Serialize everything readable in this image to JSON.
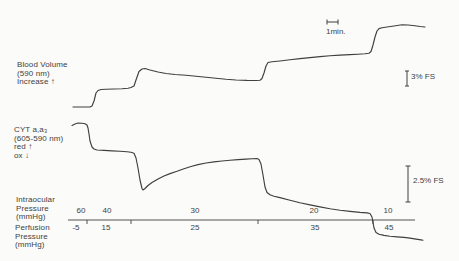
{
  "figure": {
    "bg_color": "#fbfbf9",
    "ink_color": "#3f3f3f"
  },
  "channel_labels": {
    "blood_volume": [
      "Blood Volume",
      "(590 nm)",
      "Increase ↑"
    ],
    "cytochrome": [
      "CYT a,a₃",
      "(605-590 nm)",
      "red ↑",
      "ox ↓"
    ]
  },
  "pressure_axis": {
    "intraocular": {
      "label": [
        "Intraocular",
        "Pressure",
        "(mmHg)"
      ],
      "values": [
        "60",
        "40",
        "30",
        "20",
        "10"
      ]
    },
    "perfusion": {
      "label": [
        "Perfusion",
        "Pressure",
        "(mmHg)"
      ],
      "values": [
        "-5",
        "15",
        "25",
        "35",
        "45"
      ]
    }
  },
  "scale_bars": {
    "time_label": "1min.",
    "blood_volume_label": "3% FS",
    "cytochrome_label": "2.5% FS"
  },
  "chart_data": {
    "type": "line",
    "title": "",
    "x_axis": {
      "label": "time",
      "scale_bar_minutes": 1,
      "scale_bar_px": 11
    },
    "y_axis": {
      "label": "% full scale",
      "scale_bars": [
        {
          "series": "Blood Volume (590 nm)",
          "label": "3% FS",
          "px": 15
        },
        {
          "series": "CYT a,a3 (605-590 nm)",
          "label": "2.5% FS",
          "px": 36
        }
      ]
    },
    "protocol_steps": [
      {
        "intraocular_mmHg": 60,
        "perfusion_mmHg": -5
      },
      {
        "intraocular_mmHg": 40,
        "perfusion_mmHg": 15
      },
      {
        "intraocular_mmHg": 30,
        "perfusion_mmHg": 25
      },
      {
        "intraocular_mmHg": 20,
        "perfusion_mmHg": 35
      },
      {
        "intraocular_mmHg": 10,
        "perfusion_mmHg": 45
      }
    ],
    "axis_line_px": {
      "x1": 68,
      "x2": 415,
      "y": 220,
      "tick_x": [
        87,
        131,
        258,
        373
      ],
      "tick_len": 4
    },
    "scale_bar_geometry_px": {
      "time": {
        "x1": 327,
        "x2": 338,
        "y": 22,
        "serif": 2.5
      },
      "blood_volume": {
        "x": 407,
        "y1": 71,
        "y2": 86,
        "serif": 2
      },
      "cytochrome": {
        "x": 408,
        "y1": 166,
        "y2": 202,
        "serif": 2.5
      }
    },
    "series": [
      {
        "name": "Blood Volume (590 nm)",
        "points_px": [
          [
            73,
            107
          ],
          [
            90,
            107
          ],
          [
            92,
            106
          ],
          [
            94,
            101
          ],
          [
            96,
            93
          ],
          [
            98,
            90.5
          ],
          [
            101,
            89.5
          ],
          [
            106,
            89.3
          ],
          [
            114,
            89
          ],
          [
            122,
            88.7
          ],
          [
            128,
            88.3
          ],
          [
            131,
            87.5
          ],
          [
            134,
            86
          ],
          [
            136,
            80
          ],
          [
            139,
            71.5
          ],
          [
            142,
            69
          ],
          [
            145,
            68.5
          ],
          [
            150,
            70
          ],
          [
            158,
            72
          ],
          [
            166,
            73.5
          ],
          [
            175,
            74.5
          ],
          [
            186,
            75.2
          ],
          [
            196,
            76.3
          ],
          [
            206,
            77.3
          ],
          [
            216,
            78.3
          ],
          [
            226,
            79.3
          ],
          [
            236,
            80
          ],
          [
            247,
            80.4
          ],
          [
            256,
            80.5
          ],
          [
            260,
            80.3
          ],
          [
            262,
            78.5
          ],
          [
            264,
            73
          ],
          [
            266,
            66
          ],
          [
            268,
            62.5
          ],
          [
            272,
            61.8
          ],
          [
            280,
            61
          ],
          [
            290,
            59.8
          ],
          [
            300,
            58.6
          ],
          [
            310,
            57.6
          ],
          [
            320,
            56.6
          ],
          [
            330,
            55.7
          ],
          [
            340,
            55.1
          ],
          [
            350,
            54.6
          ],
          [
            358,
            54.2
          ],
          [
            365,
            53.8
          ],
          [
            369,
            53.2
          ],
          [
            371,
            51.5
          ],
          [
            373,
            45
          ],
          [
            375,
            37
          ],
          [
            377,
            31
          ],
          [
            379,
            28.6
          ],
          [
            382,
            27.8
          ],
          [
            387,
            27
          ],
          [
            394,
            26
          ],
          [
            402,
            24.8
          ],
          [
            408,
            25
          ],
          [
            415,
            25.8
          ],
          [
            420,
            26.5
          ],
          [
            425,
            27
          ]
        ]
      },
      {
        "name": "CYT a,a3 (605-590 nm)",
        "points_px": [
          [
            72,
            125.5
          ],
          [
            75,
            124
          ],
          [
            78,
            123
          ],
          [
            82,
            123.2
          ],
          [
            85,
            123.8
          ],
          [
            87,
            125
          ],
          [
            88,
            128
          ],
          [
            89,
            134
          ],
          [
            90,
            141
          ],
          [
            92,
            147
          ],
          [
            94,
            149
          ],
          [
            97,
            150
          ],
          [
            104,
            150.4
          ],
          [
            112,
            150.9
          ],
          [
            120,
            151.3
          ],
          [
            127,
            151.8
          ],
          [
            131,
            152.3
          ],
          [
            134,
            153.2
          ],
          [
            136,
            158
          ],
          [
            138,
            168
          ],
          [
            140,
            180
          ],
          [
            142,
            188.5
          ],
          [
            143,
            190
          ],
          [
            145,
            188.5
          ],
          [
            148,
            185.5
          ],
          [
            152,
            182.5
          ],
          [
            158,
            179
          ],
          [
            164,
            176
          ],
          [
            170,
            173.6
          ],
          [
            177,
            171.3
          ],
          [
            184,
            168.8
          ],
          [
            191,
            166.5
          ],
          [
            198,
            164.6
          ],
          [
            206,
            163
          ],
          [
            214,
            161.9
          ],
          [
            222,
            161
          ],
          [
            230,
            160.2
          ],
          [
            238,
            159.6
          ],
          [
            246,
            159.1
          ],
          [
            252,
            158.8
          ],
          [
            257,
            158.5
          ],
          [
            259,
            159.5
          ],
          [
            261,
            164
          ],
          [
            263,
            175
          ],
          [
            265,
            187
          ],
          [
            267,
            192.5
          ],
          [
            270,
            194.8
          ],
          [
            274,
            196.2
          ],
          [
            280,
            197.6
          ],
          [
            290,
            200.3
          ],
          [
            300,
            202.8
          ],
          [
            310,
            204.9
          ],
          [
            320,
            206.9
          ],
          [
            330,
            208.8
          ],
          [
            340,
            210.3
          ],
          [
            350,
            211.4
          ],
          [
            360,
            212.4
          ],
          [
            367,
            212.9
          ],
          [
            370,
            213.5
          ],
          [
            372,
            217
          ],
          [
            374,
            228
          ],
          [
            376,
            232.5
          ],
          [
            379,
            234.3
          ],
          [
            384,
            235.4
          ],
          [
            390,
            236.3
          ],
          [
            397,
            236.9
          ],
          [
            404,
            237.4
          ],
          [
            410,
            238.1
          ],
          [
            416,
            239.1
          ],
          [
            421,
            239.9
          ],
          [
            423,
            240.2
          ]
        ]
      }
    ]
  }
}
